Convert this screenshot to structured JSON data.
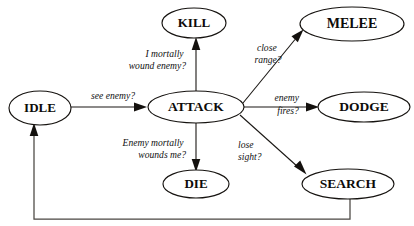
{
  "diagram": {
    "type": "state-transition-diagram",
    "background_color": "#ffffff",
    "stroke_color": "#15120f",
    "nodes": [
      {
        "id": "idle",
        "label": "IDLE",
        "cx": 40,
        "cy": 108,
        "rx": 31,
        "ry": 17,
        "font_size": 13
      },
      {
        "id": "attack",
        "label": "ATTACK",
        "cx": 196,
        "cy": 107,
        "rx": 48,
        "ry": 16,
        "font_size": 13.5
      },
      {
        "id": "kill",
        "label": "KILL",
        "cx": 194,
        "cy": 23,
        "rx": 32,
        "ry": 15,
        "font_size": 13
      },
      {
        "id": "melee",
        "label": "MELEE",
        "cx": 352,
        "cy": 24,
        "rx": 52,
        "ry": 17,
        "font_size": 14
      },
      {
        "id": "dodge",
        "label": "DODGE",
        "cx": 364,
        "cy": 107,
        "rx": 46,
        "ry": 15,
        "font_size": 13.5
      },
      {
        "id": "die",
        "label": "DIE",
        "cx": 196,
        "cy": 184,
        "rx": 33,
        "ry": 14,
        "font_size": 13
      },
      {
        "id": "search",
        "label": "SEARCH",
        "cx": 348,
        "cy": 184,
        "rx": 46,
        "ry": 15,
        "font_size": 13.5
      }
    ],
    "edges": [
      {
        "id": "idle-attack",
        "from": "idle",
        "to": "attack",
        "label_lines": [
          "see enemy?"
        ],
        "label_x": 113,
        "label_y": 99,
        "label_align": "c"
      },
      {
        "id": "attack-kill",
        "from": "attack",
        "to": "kill",
        "label_lines": [
          "I mortally",
          "wound enemy?"
        ],
        "label_x": 186,
        "label_y": 57,
        "label_align": "e"
      },
      {
        "id": "attack-melee",
        "from": "attack",
        "to": "melee",
        "label_lines": [
          "close",
          "range?"
        ],
        "label_x": 268,
        "label_y": 51,
        "label_align": "c"
      },
      {
        "id": "attack-dodge",
        "from": "attack",
        "to": "dodge",
        "label_lines": [
          "enemy",
          "fires?"
        ],
        "label_x": 288,
        "label_y": 101,
        "label_align": "c"
      },
      {
        "id": "attack-die",
        "from": "attack",
        "to": "die",
        "label_lines": [
          "Enemy mortally",
          "wounds me?"
        ],
        "label_x": 186,
        "label_y": 146,
        "label_align": "e"
      },
      {
        "id": "attack-search",
        "from": "attack",
        "to": "search",
        "label_lines": [
          "lose",
          "sight?"
        ],
        "label_x": 241,
        "label_y": 148,
        "label_align": "s"
      },
      {
        "id": "search-idle",
        "from": "search",
        "to": "idle",
        "label_lines": [],
        "label_x": 0,
        "label_y": 0,
        "label_align": "c"
      }
    ]
  }
}
